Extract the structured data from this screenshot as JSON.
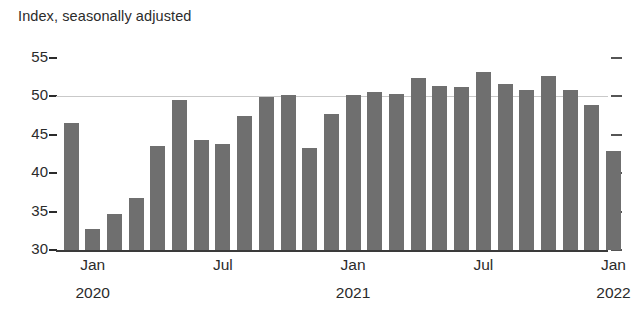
{
  "chart_data": {
    "type": "bar",
    "title": "Index, seasonally adjusted",
    "subtitle": "",
    "xlabel": "",
    "ylabel": "",
    "ylim": [
      30,
      56
    ],
    "grid": "single gridline at 50",
    "gridline_value": 50,
    "legend": "none",
    "bar_color": "#6f6f6f",
    "axis_color": "#3a3a3a",
    "y_ticks": [
      30,
      35,
      40,
      45,
      50,
      55
    ],
    "y_tick_labels": [
      "30_",
      "35_",
      "40_",
      "45_",
      "50_",
      "55_"
    ],
    "x_tick_labels": [
      "Jan",
      "Jul",
      "Jan",
      "Jul",
      "Jan"
    ],
    "x_year_labels": [
      "2020",
      "2021",
      "2022"
    ],
    "categories": [
      "Dec 2019",
      "Jan 2020",
      "Feb 2020",
      "Mar 2020",
      "Apr 2020",
      "May 2020",
      "Jun 2020",
      "Jul 2020",
      "Aug 2020",
      "Sep 2020",
      "Oct 2020",
      "Nov 2020",
      "Dec 2020",
      "Jan 2021",
      "Feb 2021",
      "Mar 2021",
      "Apr 2021",
      "May 2021",
      "Jun 2021",
      "Jul 2021",
      "Aug 2021",
      "Sep 2021",
      "Oct 2021",
      "Nov 2021",
      "Dec 2021",
      "Jan 2022"
    ],
    "values": [
      46.6,
      32.8,
      34.7,
      36.8,
      43.6,
      49.5,
      44.3,
      43.8,
      47.5,
      49.9,
      50.2,
      43.3,
      47.7,
      50.2,
      50.6,
      50.3,
      52.4,
      51.3,
      51.2,
      53.2,
      51.6,
      50.9,
      52.6,
      50.9,
      48.9,
      42.9
    ]
  }
}
